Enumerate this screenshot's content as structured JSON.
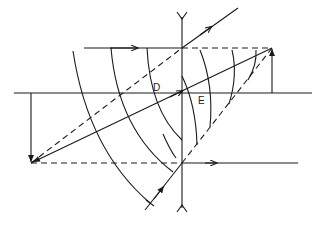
{
  "diagram": {
    "type": "optics-ray-diagram",
    "labels": {
      "point_d": "D",
      "point_e": "E"
    },
    "colors": {
      "ink": "#1a1a1a",
      "background": "#ffffff"
    },
    "elements": {
      "optical_axis": "horizontal solid line",
      "lens": "vertical line with Y-shaped end caps (diverging lens symbol)",
      "object_arrow": "vertical arrow pointing down at left",
      "image_arrow": "vertical arrow pointing up at right",
      "rays": [
        "parallel ray top",
        "central ray",
        "refracted ray up-right",
        "parallel ray bottom",
        "incoming ray lower"
      ],
      "construction_lines": "dashed",
      "wavefronts": "curved arcs"
    }
  }
}
